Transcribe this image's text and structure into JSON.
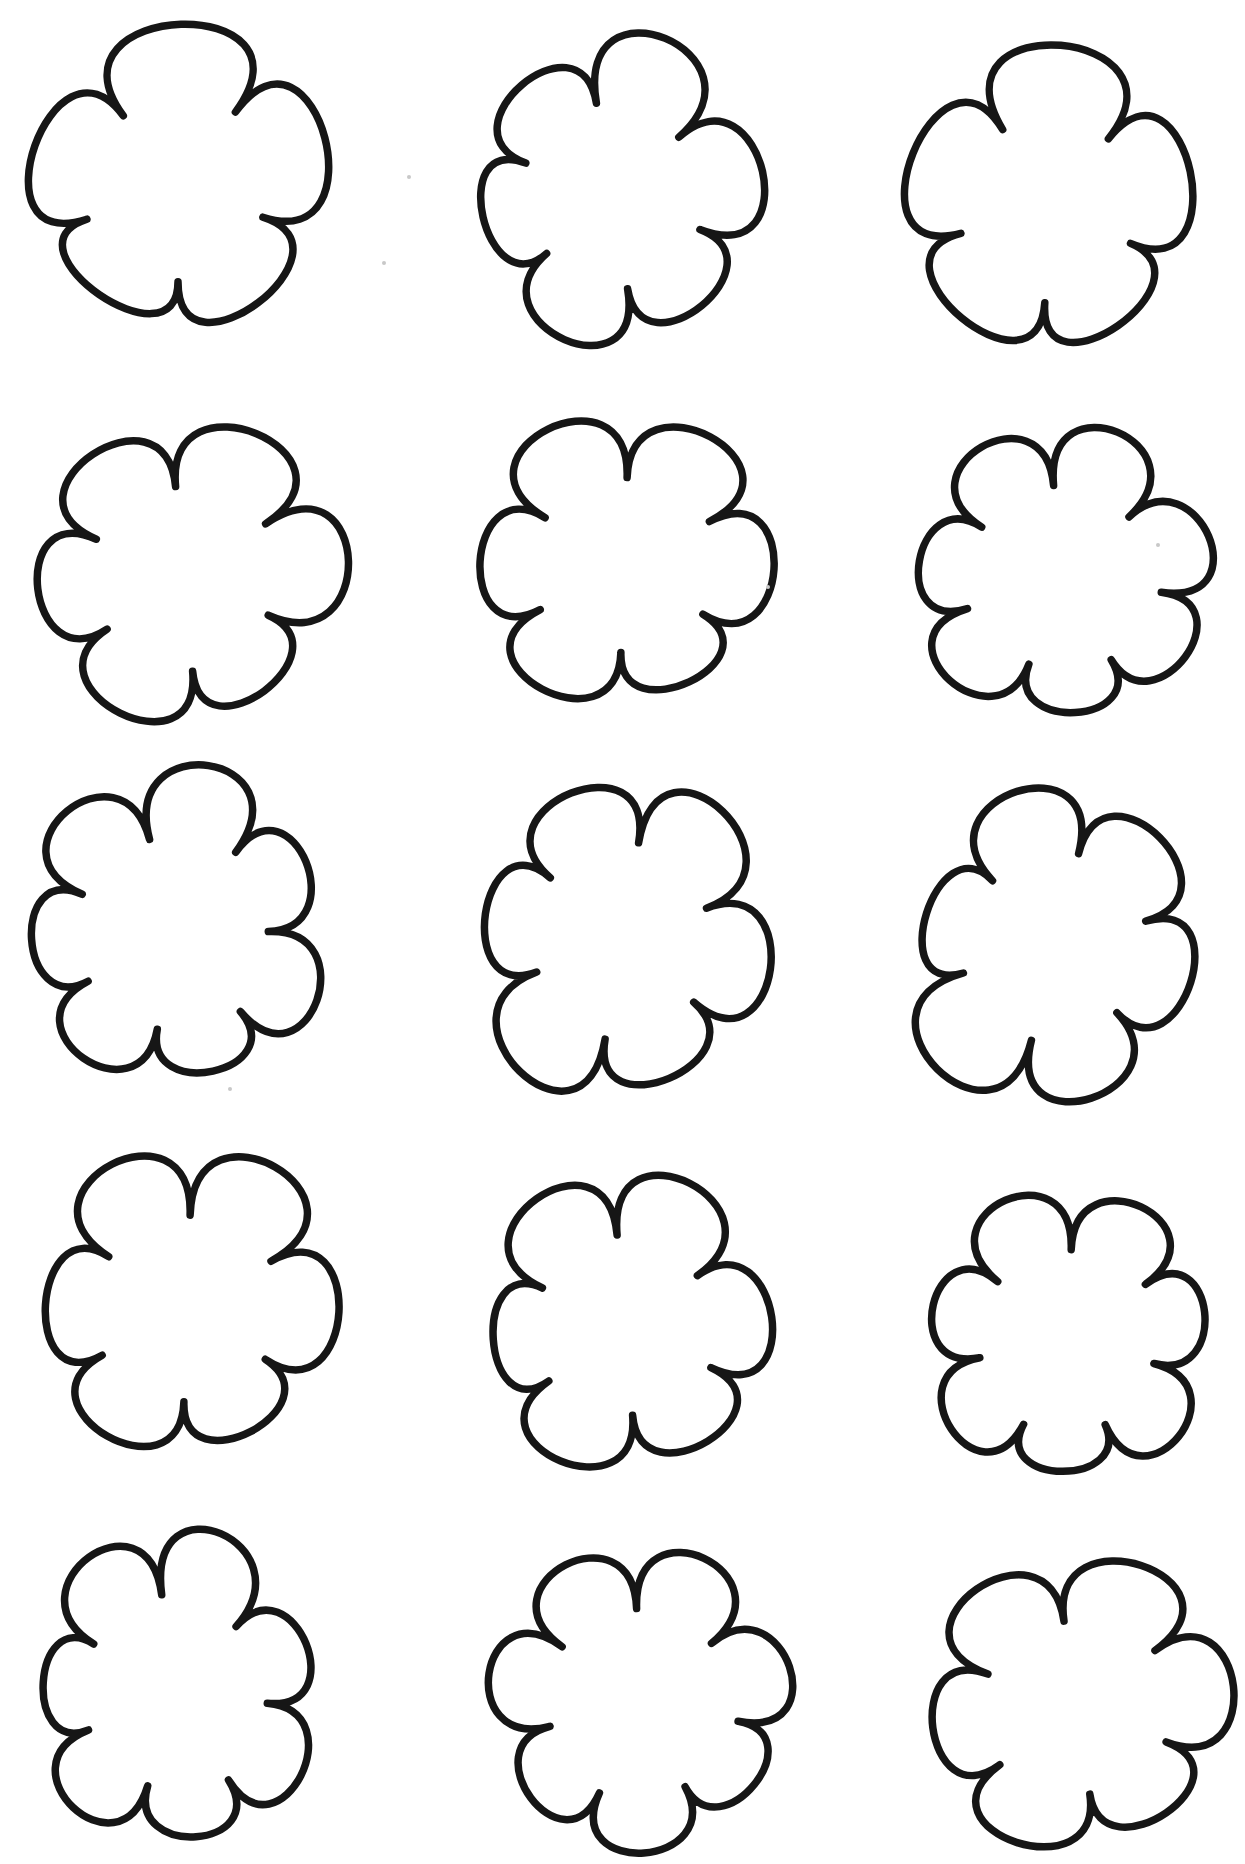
{
  "page": {
    "kind": "printable-template-sheet",
    "background_color": "#ffffff",
    "width": 1245,
    "height": 1864
  },
  "drawing": {
    "stroke_color": "#161616",
    "stroke_width": 7.5,
    "fill_color": "#ffffff",
    "style": "hand-drawn-outline"
  },
  "grid": {
    "rows": 5,
    "columns": 3,
    "shape_count": 15,
    "shape": "flower-cloud-outline"
  },
  "flowers": [
    {
      "id": "flower-r1c1",
      "row": 1,
      "col": 1,
      "cx": 178,
      "cy": 190,
      "rx": 150,
      "ry": 148,
      "petals": 5,
      "phase": -126,
      "inner": 0.62,
      "petal_sizes": [
        1.12,
        1.04,
        0.93,
        0.88,
        1.0
      ],
      "notch_jitter": [
        1.0,
        1.05,
        0.96,
        1.0,
        1.03
      ]
    },
    {
      "id": "flower-r1c2",
      "row": 1,
      "col": 2,
      "cx": 612,
      "cy": 196,
      "rx": 145,
      "ry": 152,
      "petals": 6,
      "phase": -100,
      "inner": 0.62,
      "petal_sizes": [
        1.1,
        1.05,
        0.95,
        1.0,
        0.9,
        0.96
      ],
      "notch_jitter": [
        1.0,
        0.97,
        1.04,
        1.0,
        0.95,
        1.02
      ]
    },
    {
      "id": "flower-r1c3",
      "row": 1,
      "col": 3,
      "cx": 1051,
      "cy": 210,
      "rx": 144,
      "ry": 150,
      "petals": 5,
      "phase": -122,
      "inner": 0.62,
      "petal_sizes": [
        1.1,
        1.0,
        0.9,
        0.95,
        1.03
      ],
      "notch_jitter": [
        1.02,
        1.0,
        0.96,
        1.0,
        1.04
      ]
    },
    {
      "id": "flower-r2c1",
      "row": 2,
      "col": 1,
      "cx": 184,
      "cy": 578,
      "rx": 156,
      "ry": 148,
      "petals": 6,
      "phase": -95,
      "inner": 0.62,
      "petal_sizes": [
        1.08,
        1.06,
        0.92,
        1.0,
        0.94,
        1.02
      ],
      "notch_jitter": [
        1.0,
        1.03,
        0.96,
        1.02,
        0.97,
        1.0
      ]
    },
    {
      "id": "flower-r2c2",
      "row": 2,
      "col": 2,
      "cx": 624,
      "cy": 566,
      "rx": 150,
      "ry": 147,
      "petals": 6,
      "phase": -88,
      "inner": 0.62,
      "petal_sizes": [
        1.05,
        1.0,
        0.9,
        1.0,
        0.96,
        1.06
      ],
      "notch_jitter": [
        0.97,
        1.04,
        1.0,
        0.95,
        1.02,
        1.0
      ]
    },
    {
      "id": "flower-r2c3",
      "row": 2,
      "col": 3,
      "cx": 1062,
      "cy": 579,
      "rx": 153,
      "ry": 149,
      "petals": 7,
      "phase": -95,
      "inner": 0.63,
      "petal_sizes": [
        1.05,
        1.0,
        0.96,
        0.9,
        1.0,
        0.94,
        1.03
      ],
      "notch_jitter": [
        1.0,
        0.96,
        1.04,
        1.0,
        0.97,
        1.03,
        1.0
      ]
    },
    {
      "id": "flower-r3c1",
      "row": 3,
      "col": 1,
      "cx": 175,
      "cy": 935,
      "rx": 156,
      "ry": 157,
      "petals": 7,
      "phase": -105,
      "inner": 0.63,
      "petal_sizes": [
        1.1,
        0.96,
        1.0,
        0.9,
        0.98,
        0.92,
        1.05
      ],
      "notch_jitter": [
        1.0,
        1.04,
        0.95,
        1.02,
        0.97,
        1.0,
        1.03
      ]
    },
    {
      "id": "flower-r3c2",
      "row": 3,
      "col": 2,
      "cx": 622,
      "cy": 940,
      "rx": 151,
      "ry": 156,
      "petals": 6,
      "phase": -80,
      "inner": 0.62,
      "petal_sizes": [
        1.06,
        1.0,
        0.94,
        1.08,
        0.92,
        1.0
      ],
      "notch_jitter": [
        1.02,
        0.96,
        1.0,
        1.04,
        0.97,
        1.0
      ]
    },
    {
      "id": "flower-r3c3",
      "row": 3,
      "col": 3,
      "cx": 1055,
      "cy": 947,
      "rx": 147,
      "ry": 156,
      "petals": 6,
      "phase": -75,
      "inner": 0.62,
      "petal_sizes": [
        1.0,
        0.95,
        1.0,
        1.12,
        0.9,
        1.03
      ],
      "notch_jitter": [
        1.0,
        1.03,
        0.96,
        1.0,
        1.04,
        0.97
      ]
    },
    {
      "id": "flower-r4c1",
      "row": 4,
      "col": 1,
      "cx": 187,
      "cy": 1308,
      "rx": 149,
      "ry": 156,
      "petals": 6,
      "phase": -88,
      "inner": 0.62,
      "petal_sizes": [
        1.08,
        1.02,
        0.9,
        0.98,
        0.95,
        1.05
      ],
      "notch_jitter": [
        0.96,
        1.03,
        1.0,
        0.97,
        1.04,
        1.0
      ]
    },
    {
      "id": "flower-r4c2",
      "row": 4,
      "col": 2,
      "cx": 625,
      "cy": 1327,
      "rx": 147,
      "ry": 149,
      "petals": 6,
      "phase": -95,
      "inner": 0.62,
      "petal_sizes": [
        1.06,
        1.0,
        0.95,
        1.0,
        0.9,
        1.05
      ],
      "notch_jitter": [
        1.0,
        0.97,
        1.04,
        0.96,
        1.02,
        1.0
      ]
    },
    {
      "id": "flower-r4c3",
      "row": 4,
      "col": 3,
      "cx": 1068,
      "cy": 1341,
      "rx": 147,
      "ry": 145,
      "petals": 7,
      "phase": -88,
      "inner": 0.63,
      "petal_sizes": [
        1.05,
        0.95,
        1.0,
        0.9,
        1.0,
        0.95,
        1.06
      ],
      "notch_jitter": [
        1.0,
        1.04,
        0.96,
        1.0,
        1.03,
        0.97,
        1.0
      ]
    },
    {
      "id": "flower-r5c1",
      "row": 5,
      "col": 1,
      "cx": 175,
      "cy": 1695,
      "rx": 147,
      "ry": 156,
      "petals": 7,
      "phase": -98,
      "inner": 0.63,
      "petal_sizes": [
        1.08,
        0.95,
        1.0,
        0.92,
        1.0,
        0.9,
        1.06
      ],
      "notch_jitter": [
        1.03,
        0.96,
        1.0,
        1.04,
        0.97,
        1.0,
        1.02
      ]
    },
    {
      "id": "flower-r5c2",
      "row": 5,
      "col": 2,
      "cx": 640,
      "cy": 1703,
      "rx": 154,
      "ry": 150,
      "petals": 7,
      "phase": -92,
      "inner": 0.63,
      "petal_sizes": [
        1.05,
        1.0,
        0.92,
        1.0,
        0.95,
        1.0,
        1.04
      ],
      "notch_jitter": [
        1.0,
        0.97,
        1.03,
        1.0,
        1.04,
        0.96,
        1.0
      ]
    },
    {
      "id": "flower-r5c3",
      "row": 5,
      "col": 3,
      "cx": 1077,
      "cy": 1708,
      "rx": 155,
      "ry": 146,
      "petals": 6,
      "phase": -98,
      "inner": 0.62,
      "petal_sizes": [
        1.06,
        1.02,
        0.92,
        1.0,
        0.94,
        1.04
      ],
      "notch_jitter": [
        0.97,
        1.03,
        1.0,
        0.96,
        1.02,
        1.0
      ]
    }
  ],
  "scan_specks": {
    "color": "#c8c8c8",
    "radius": 2,
    "points": [
      {
        "x": 409,
        "y": 177
      },
      {
        "x": 384,
        "y": 263
      },
      {
        "x": 768,
        "y": 587
      },
      {
        "x": 1158,
        "y": 545
      },
      {
        "x": 230,
        "y": 1089
      }
    ]
  }
}
